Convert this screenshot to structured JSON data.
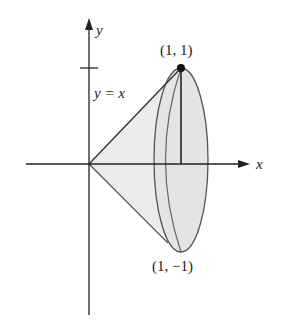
{
  "diagram": {
    "axes": {
      "x_label": "x",
      "y_label": "y"
    },
    "curve_label": "y = x",
    "points": [
      {
        "label": "(1, 1)"
      },
      {
        "label": "(1, −1)"
      }
    ],
    "colors": {
      "stroke": "#333333",
      "fill": "#e6e6e6"
    }
  }
}
